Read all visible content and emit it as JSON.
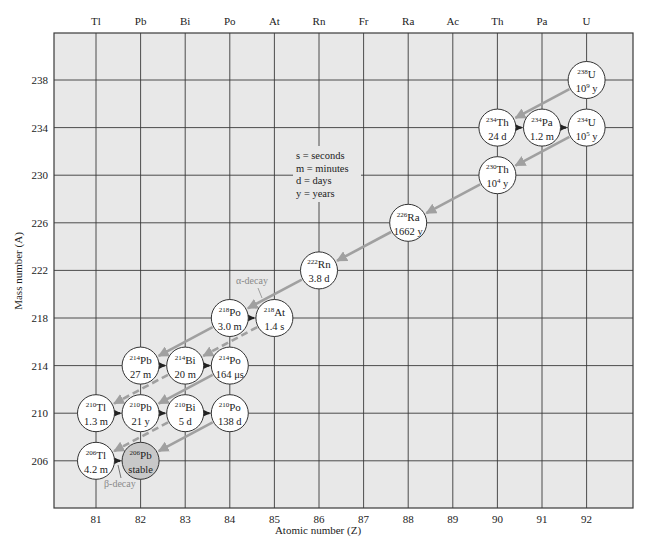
{
  "chart_data": {
    "type": "diagram",
    "xlabel": "Atomic number (Z)",
    "ylabel": "Mass number (A)",
    "x_ticks": [
      81,
      82,
      83,
      84,
      85,
      86,
      87,
      88,
      89,
      90,
      91,
      92
    ],
    "y_ticks": [
      206,
      210,
      214,
      218,
      222,
      226,
      230,
      234,
      238
    ],
    "top_element_labels": [
      {
        "z": 81,
        "symbol": "Tl"
      },
      {
        "z": 82,
        "symbol": "Pb"
      },
      {
        "z": 83,
        "symbol": "Bi"
      },
      {
        "z": 84,
        "symbol": "Po"
      },
      {
        "z": 85,
        "symbol": "At"
      },
      {
        "z": 86,
        "symbol": "Rn"
      },
      {
        "z": 87,
        "symbol": "Fr"
      },
      {
        "z": 88,
        "symbol": "Ra"
      },
      {
        "z": 89,
        "symbol": "Ac"
      },
      {
        "z": 90,
        "symbol": "Th"
      },
      {
        "z": 91,
        "symbol": "Pa"
      },
      {
        "z": 92,
        "symbol": "U"
      }
    ],
    "xlim": [
      80.1,
      93.1
    ],
    "ylim": [
      202.1,
      241.9
    ],
    "grid": true,
    "legend": {
      "lines": [
        "s = seconds",
        "m = minutes",
        "d = days",
        "y = years"
      ]
    },
    "annotations": [
      {
        "text": "α-decay",
        "near": "218Po"
      },
      {
        "text": "β-decay",
        "near": "206Tl"
      }
    ],
    "nuclides": [
      {
        "id": "U238",
        "z": 92,
        "a": 238,
        "mass": "238",
        "symbol": "U",
        "half_life": "10",
        "exp": "9",
        "unit": "y"
      },
      {
        "id": "Th234",
        "z": 90,
        "a": 234,
        "mass": "234",
        "symbol": "Th",
        "half_life": "24 d"
      },
      {
        "id": "Pa234",
        "z": 91,
        "a": 234,
        "mass": "234",
        "symbol": "Pa",
        "half_life": "1.2 m"
      },
      {
        "id": "U234",
        "z": 92,
        "a": 234,
        "mass": "234",
        "symbol": "U",
        "half_life": "10",
        "exp": "5",
        "unit": "y"
      },
      {
        "id": "Th230",
        "z": 90,
        "a": 230,
        "mass": "230",
        "symbol": "Th",
        "half_life": "10",
        "exp": "4",
        "unit": "y"
      },
      {
        "id": "Ra226",
        "z": 88,
        "a": 226,
        "mass": "226",
        "symbol": "Ra",
        "half_life": "1662 y"
      },
      {
        "id": "Rn222",
        "z": 86,
        "a": 222,
        "mass": "222",
        "symbol": "Rn",
        "half_life": "3.8 d"
      },
      {
        "id": "Po218",
        "z": 84,
        "a": 218,
        "mass": "218",
        "symbol": "Po",
        "half_life": "3.0 m"
      },
      {
        "id": "At218",
        "z": 85,
        "a": 218,
        "mass": "218",
        "symbol": "At",
        "half_life": "1.4 s"
      },
      {
        "id": "Pb214",
        "z": 82,
        "a": 214,
        "mass": "214",
        "symbol": "Pb",
        "half_life": "27 m"
      },
      {
        "id": "Bi214",
        "z": 83,
        "a": 214,
        "mass": "214",
        "symbol": "Bi",
        "half_life": "20 m"
      },
      {
        "id": "Po214",
        "z": 84,
        "a": 214,
        "mass": "214",
        "symbol": "Po",
        "half_life": "164 μs"
      },
      {
        "id": "Tl210",
        "z": 81,
        "a": 210,
        "mass": "210",
        "symbol": "Tl",
        "half_life": "1.3 m"
      },
      {
        "id": "Pb210",
        "z": 82,
        "a": 210,
        "mass": "210",
        "symbol": "Pb",
        "half_life": "21 y"
      },
      {
        "id": "Bi210",
        "z": 83,
        "a": 210,
        "mass": "210",
        "symbol": "Bi",
        "half_life": "5 d"
      },
      {
        "id": "Po210",
        "z": 84,
        "a": 210,
        "mass": "210",
        "symbol": "Po",
        "half_life": "138 d"
      },
      {
        "id": "Tl206",
        "z": 81,
        "a": 206,
        "mass": "206",
        "symbol": "Tl",
        "half_life": "4.2 m"
      },
      {
        "id": "Pb206",
        "z": 82,
        "a": 206,
        "mass": "206",
        "symbol": "Pb",
        "half_life": "stable",
        "stable": true
      }
    ],
    "alpha_decays": [
      {
        "from": "U238",
        "to": "Th234",
        "style": "solid"
      },
      {
        "from": "U234",
        "to": "Th230",
        "style": "solid"
      },
      {
        "from": "Th230",
        "to": "Ra226",
        "style": "solid"
      },
      {
        "from": "Ra226",
        "to": "Rn222",
        "style": "solid"
      },
      {
        "from": "Rn222",
        "to": "Po218",
        "style": "solid"
      },
      {
        "from": "Po218",
        "to": "Pb214",
        "style": "solid"
      },
      {
        "from": "At218",
        "to": "Bi214",
        "style": "dashed"
      },
      {
        "from": "Bi214",
        "to": "Tl210",
        "style": "dashed"
      },
      {
        "from": "Po214",
        "to": "Pb210",
        "style": "solid"
      },
      {
        "from": "Bi210",
        "to": "Tl206",
        "style": "dashed"
      },
      {
        "from": "Po210",
        "to": "Pb206",
        "style": "solid"
      }
    ],
    "beta_decays": [
      {
        "from": "Th234",
        "to": "Pa234"
      },
      {
        "from": "Pa234",
        "to": "U234"
      },
      {
        "from": "Po218",
        "to": "At218"
      },
      {
        "from": "Pb214",
        "to": "Bi214"
      },
      {
        "from": "Bi214",
        "to": "Po214"
      },
      {
        "from": "Tl210",
        "to": "Pb210"
      },
      {
        "from": "Pb210",
        "to": "Bi210"
      },
      {
        "from": "Bi210",
        "to": "Po210"
      },
      {
        "from": "Tl206",
        "to": "Pb206"
      }
    ]
  },
  "colors": {
    "plot_bg": "#e8e8e8",
    "grid": "#3a3a3a",
    "alpha_arrow": "#a0a0a0",
    "beta_arrow": "#222222",
    "node_fill": "#ffffff",
    "stable_fill": "#c8c8c8",
    "annotation": "#8a8a8a"
  }
}
